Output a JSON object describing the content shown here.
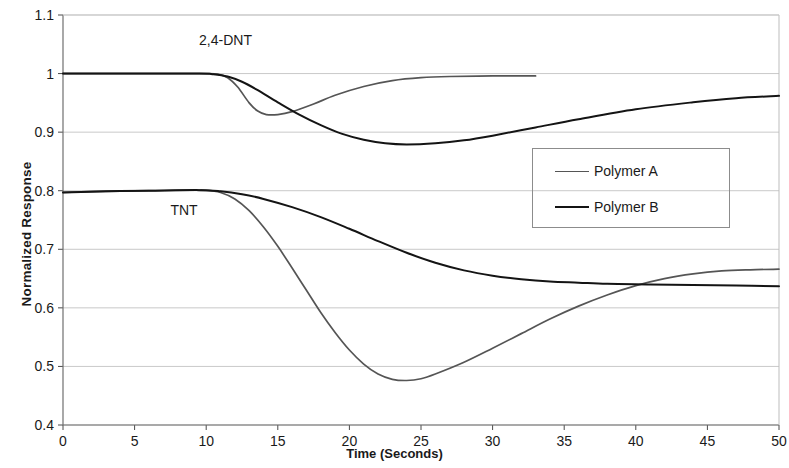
{
  "chart_data": {
    "type": "line",
    "title": "",
    "xlabel": "Time (Seconds)",
    "ylabel": "Normalized Response",
    "xlim": [
      0,
      50
    ],
    "ylim": [
      0.4,
      1.1
    ],
    "xticks": [
      "0",
      "5",
      "10",
      "15",
      "20",
      "25",
      "30",
      "35",
      "40",
      "45",
      "50"
    ],
    "yticks": [
      "0.4",
      "0.5",
      "0.6",
      "0.7",
      "0.8",
      "0.9",
      "1",
      "1.1"
    ],
    "grid": "horizontal",
    "legend": {
      "position": "center-right",
      "entries": [
        {
          "name": "Polymer A",
          "color": "#555555"
        },
        {
          "name": "Polymer B",
          "color": "#141414"
        }
      ]
    },
    "annotations": [
      {
        "text": "2,4-DNT",
        "x": 9.5,
        "y": 1.055
      },
      {
        "text": "TNT",
        "x": 7.5,
        "y": 0.765
      }
    ],
    "series": [
      {
        "name": "2,4-DNT Polymer A",
        "analyte": "2,4-DNT",
        "polymer": "Polymer A",
        "color": "#555555",
        "points": [
          [
            0,
            1.0
          ],
          [
            5,
            1.0
          ],
          [
            9,
            1.0
          ],
          [
            10,
            1.0
          ],
          [
            10.8,
            0.999
          ],
          [
            11.5,
            0.993
          ],
          [
            12.2,
            0.977
          ],
          [
            13.0,
            0.95
          ],
          [
            13.6,
            0.936
          ],
          [
            14.2,
            0.93
          ],
          [
            15.0,
            0.93
          ],
          [
            16.0,
            0.935
          ],
          [
            17.5,
            0.948
          ],
          [
            19.0,
            0.963
          ],
          [
            21.0,
            0.978
          ],
          [
            23.0,
            0.988
          ],
          [
            25.0,
            0.993
          ],
          [
            27.0,
            0.995
          ],
          [
            30.0,
            0.996
          ],
          [
            33.0,
            0.996
          ]
        ]
      },
      {
        "name": "2,4-DNT Polymer B",
        "analyte": "2,4-DNT",
        "polymer": "Polymer B",
        "color": "#141414",
        "points": [
          [
            0,
            1.0
          ],
          [
            5,
            1.0
          ],
          [
            9.5,
            1.0
          ],
          [
            10.5,
            0.999
          ],
          [
            11.5,
            0.995
          ],
          [
            12.5,
            0.986
          ],
          [
            13.5,
            0.973
          ],
          [
            15.0,
            0.951
          ],
          [
            16.5,
            0.93
          ],
          [
            18.0,
            0.912
          ],
          [
            19.5,
            0.897
          ],
          [
            21.0,
            0.887
          ],
          [
            22.5,
            0.881
          ],
          [
            24.0,
            0.879
          ],
          [
            26.0,
            0.881
          ],
          [
            28.0,
            0.886
          ],
          [
            30.0,
            0.894
          ],
          [
            33.0,
            0.908
          ],
          [
            36.0,
            0.922
          ],
          [
            40.0,
            0.939
          ],
          [
            44.0,
            0.951
          ],
          [
            47.0,
            0.958
          ],
          [
            50.0,
            0.962
          ]
        ]
      },
      {
        "name": "TNT Polymer A",
        "analyte": "TNT",
        "polymer": "Polymer A",
        "color": "#555555",
        "points": [
          [
            0,
            0.797
          ],
          [
            3,
            0.799
          ],
          [
            6,
            0.8
          ],
          [
            9,
            0.801
          ],
          [
            10,
            0.801
          ],
          [
            11,
            0.797
          ],
          [
            12,
            0.786
          ],
          [
            13,
            0.766
          ],
          [
            14,
            0.738
          ],
          [
            15,
            0.705
          ],
          [
            16,
            0.668
          ],
          [
            17,
            0.63
          ],
          [
            18,
            0.592
          ],
          [
            19,
            0.558
          ],
          [
            20,
            0.528
          ],
          [
            21,
            0.504
          ],
          [
            22,
            0.487
          ],
          [
            23,
            0.478
          ],
          [
            24,
            0.476
          ],
          [
            25,
            0.479
          ],
          [
            26,
            0.487
          ],
          [
            28,
            0.507
          ],
          [
            30,
            0.531
          ],
          [
            32,
            0.556
          ],
          [
            34,
            0.581
          ],
          [
            36,
            0.603
          ],
          [
            38,
            0.622
          ],
          [
            40,
            0.638
          ],
          [
            42,
            0.65
          ],
          [
            44,
            0.658
          ],
          [
            46,
            0.663
          ],
          [
            48,
            0.665
          ],
          [
            50,
            0.666
          ]
        ]
      },
      {
        "name": "TNT Polymer B",
        "analyte": "TNT",
        "polymer": "Polymer B",
        "color": "#141414",
        "points": [
          [
            0,
            0.797
          ],
          [
            3,
            0.799
          ],
          [
            6,
            0.8
          ],
          [
            9.5,
            0.801
          ],
          [
            11,
            0.799
          ],
          [
            12.5,
            0.794
          ],
          [
            14,
            0.786
          ],
          [
            16,
            0.772
          ],
          [
            18,
            0.755
          ],
          [
            20,
            0.735
          ],
          [
            22,
            0.714
          ],
          [
            24,
            0.694
          ],
          [
            26,
            0.677
          ],
          [
            28,
            0.664
          ],
          [
            30,
            0.655
          ],
          [
            32,
            0.649
          ],
          [
            34,
            0.645
          ],
          [
            36,
            0.643
          ],
          [
            38,
            0.641
          ],
          [
            41,
            0.64
          ],
          [
            44,
            0.639
          ],
          [
            47,
            0.638
          ],
          [
            50,
            0.637
          ]
        ]
      }
    ]
  }
}
